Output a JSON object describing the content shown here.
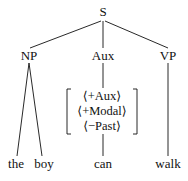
{
  "tree": {
    "root": {
      "label": "S"
    },
    "children": [
      {
        "label": "NP",
        "leaves": [
          "the",
          "boy"
        ]
      },
      {
        "label": "Aux",
        "features": [
          "⟨+Aux⟩",
          "⟨+Modal⟩",
          "⟨−Past⟩"
        ],
        "leaf": "can"
      },
      {
        "label": "VP",
        "leaf": "walk"
      }
    ]
  }
}
